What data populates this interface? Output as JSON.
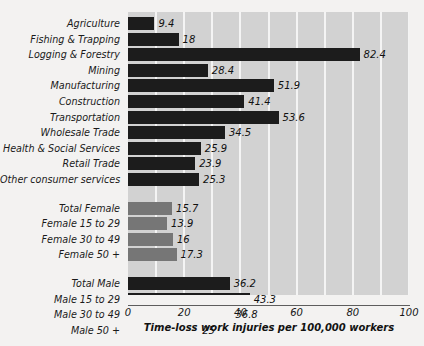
{
  "chart_data": {
    "type": "bar",
    "orientation": "horizontal",
    "title": "",
    "xlabel": "Time-loss work injuries per 100,000 workers",
    "ylabel": "",
    "xlim": [
      0,
      100
    ],
    "xticks": [
      0,
      20,
      40,
      60,
      80,
      100
    ],
    "xtick_labels": [
      "0",
      "20",
      "40",
      "60",
      "80",
      "100"
    ],
    "grid": "vertical gridlines every 10 units, white on light-gray plot background",
    "legend": "none",
    "categories": [
      "Agriculture",
      "Fishing & Trapping",
      "Logging & Forestry",
      "Mining",
      "Manufacturing",
      "Construction",
      "Transportation",
      "Wholesale Trade",
      "Health & Social Services",
      "Retail Trade",
      "Other consumer services",
      "Total Female",
      "Female 15 to 29",
      "Female 30 to 49",
      "Female 50 +",
      "Total Male",
      "Male 15 to 29",
      "Male 30 to 49",
      "Male 50 +"
    ],
    "values": [
      9.4,
      18,
      82.4,
      28.4,
      51.9,
      41.4,
      53.6,
      34.5,
      25.9,
      23.9,
      25.3,
      15.7,
      13.9,
      16,
      17.3,
      36.2,
      43.3,
      36.8,
      25
    ],
    "value_labels": [
      "9.4",
      "18",
      "82.4",
      "28.4",
      "51.9",
      "41.4",
      "53.6",
      "34.5",
      "25.9",
      "23.9",
      "25.3",
      "15.7",
      "13.9",
      "16",
      "17.3",
      "36.2",
      "43.3",
      "36.8",
      "25"
    ],
    "groups": [
      {
        "name": "Industry",
        "start": 0,
        "count": 11,
        "color": "#1c1c1c"
      },
      {
        "name": "Female",
        "start": 11,
        "count": 4,
        "color": "#767676"
      },
      {
        "name": "Male",
        "start": 15,
        "count": 4,
        "color": "#1c1c1c"
      }
    ],
    "colors": {
      "bar_dark": "#1c1c1c",
      "bar_mid": "#767676",
      "plot_background": "#d2d2d2",
      "gridline": "#f4f4f4",
      "page_background": "#f3f2f1",
      "axis_line": "#5d5d5d",
      "text": "#171717"
    }
  }
}
